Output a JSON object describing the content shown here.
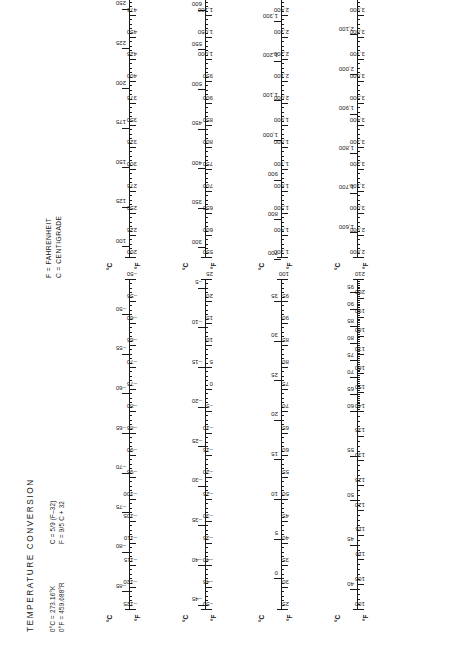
{
  "document": {
    "title": "TEMPERATURE CONVERSION",
    "constants": [
      "0°C = 273.16°K",
      "0°F = 459.688°R"
    ],
    "formulas": [
      "C = 5/9 (F–32)",
      "F = 9/5 C + 32"
    ],
    "legend": [
      "F = FAHRENHEIT",
      "C = CENTIGRADE"
    ],
    "axis_caption_c": "°C",
    "axis_caption_f": "°F"
  },
  "chart_data": {
    "type": "table",
    "title": "TEMPERATURE CONVERSION",
    "xlabel": "°F",
    "ylabel": "°C",
    "grid": false,
    "legend_position": "top-center",
    "scales": [
      {
        "id": "scale-1",
        "column": "left",
        "row": 1,
        "f_range": [
          -125,
          -50
        ],
        "c_range": [
          -87.2,
          -45.6
        ],
        "f_labels": [
          "–125",
          "–120",
          "–115",
          "–110",
          "–105",
          "–100",
          "–95",
          "–90",
          "–85",
          "–80",
          "–75",
          "–70",
          "–65",
          "–60",
          "–55",
          "–50"
        ],
        "f_values": [
          -125,
          -120,
          -115,
          -110,
          -105,
          -100,
          -95,
          -90,
          -85,
          -80,
          -75,
          -70,
          -65,
          -60,
          -55,
          -50
        ],
        "c_labels": [
          "–85",
          "–80",
          "–75",
          "–70",
          "–65",
          "–60",
          "–55",
          "–50"
        ],
        "c_values": [
          -85,
          -80,
          -75,
          -70,
          -65,
          -60,
          -55,
          -50
        ],
        "f_minor_step": 1
      },
      {
        "id": "scale-2",
        "column": "left",
        "row": 2,
        "f_range": [
          -50,
          25
        ],
        "c_range": [
          -45.6,
          -3.9
        ],
        "f_labels": [
          "–50",
          "–45",
          "–40",
          "–35",
          "–30",
          "–25",
          "–20",
          "–15",
          "–10",
          "–5",
          "0",
          "5",
          "10",
          "15",
          "20",
          "25"
        ],
        "f_values": [
          -50,
          -45,
          -40,
          -35,
          -30,
          -25,
          -20,
          -15,
          -10,
          -5,
          0,
          5,
          10,
          15,
          20,
          25
        ],
        "c_labels": [
          "–45",
          "–40",
          "–35",
          "–30",
          "–25",
          "–20",
          "–15",
          "–10",
          "–5"
        ],
        "c_values": [
          -45,
          -40,
          -35,
          -30,
          -25,
          -20,
          -15,
          -10,
          -5
        ],
        "f_minor_step": 1
      },
      {
        "id": "scale-3",
        "column": "left",
        "row": 3,
        "f_range": [
          25,
          100
        ],
        "c_range": [
          -3.9,
          37.8
        ],
        "f_labels": [
          "25",
          "30",
          "35",
          "40",
          "45",
          "50",
          "55",
          "60",
          "65",
          "70",
          "75",
          "80",
          "85",
          "90",
          "95",
          "100"
        ],
        "f_values": [
          25,
          30,
          35,
          40,
          45,
          50,
          55,
          60,
          65,
          70,
          75,
          80,
          85,
          90,
          95,
          100
        ],
        "c_labels": [
          "0",
          "5",
          "10",
          "15",
          "20",
          "25",
          "30",
          "35"
        ],
        "c_values": [
          0,
          5,
          10,
          15,
          20,
          25,
          30,
          35
        ],
        "f_minor_step": 1
      },
      {
        "id": "scale-4",
        "column": "left",
        "row": 4,
        "f_range": [
          100,
          210
        ],
        "c_range": [
          37.8,
          98.9
        ],
        "f_labels": [
          "100",
          "105",
          "110",
          "115",
          "120",
          "125",
          "130",
          "135",
          "140",
          "150",
          "160",
          "170",
          "180",
          "190",
          "200",
          "210"
        ],
        "f_values": [
          100,
          105,
          110,
          115,
          120,
          125,
          130,
          135,
          140,
          150,
          160,
          170,
          180,
          190,
          200,
          210
        ],
        "c_labels": [
          "40",
          "45",
          "50",
          "55",
          "60",
          "65",
          "70",
          "75",
          "80",
          "85",
          "90",
          "95"
        ],
        "c_values": [
          40,
          45,
          50,
          55,
          60,
          65,
          70,
          75,
          80,
          85,
          90,
          95
        ],
        "f_minor_step": 1,
        "note": "scale compresses above 140°F"
      },
      {
        "id": "scale-5",
        "column": "right",
        "row": 1,
        "f_range": [
          200,
          575
        ],
        "c_range": [
          93.3,
          301.7
        ],
        "f_labels": [
          "200",
          "225",
          "250",
          "275",
          "300",
          "325",
          "350",
          "375",
          "400",
          "425",
          "450",
          "475",
          "500",
          "525",
          "550",
          "575"
        ],
        "f_values": [
          200,
          225,
          250,
          275,
          300,
          325,
          350,
          375,
          400,
          425,
          450,
          475,
          500,
          525,
          550,
          575
        ],
        "c_labels": [
          "100",
          "125",
          "150",
          "175",
          "200",
          "225",
          "250",
          "275",
          "300"
        ],
        "c_values": [
          100,
          125,
          150,
          175,
          200,
          225,
          250,
          275,
          300
        ],
        "f_minor_step": 5
      },
      {
        "id": "scale-6",
        "column": "right",
        "row": 2,
        "f_range": [
          550,
          1300
        ],
        "c_range": [
          287.8,
          704.4
        ],
        "f_labels": [
          "550",
          "600",
          "650",
          "700",
          "750",
          "800",
          "850",
          "900",
          "950",
          "1,000",
          "1,050",
          "1,100",
          "1,150",
          "1,200",
          "1,250",
          "1,300"
        ],
        "f_values": [
          550,
          600,
          650,
          700,
          750,
          800,
          850,
          900,
          950,
          1000,
          1050,
          1100,
          1150,
          1200,
          1250,
          1300
        ],
        "c_labels": [
          "300",
          "350",
          "400",
          "450",
          "500",
          "550",
          "600",
          "650",
          "700"
        ],
        "c_values": [
          300,
          350,
          400,
          450,
          500,
          550,
          600,
          650,
          700
        ],
        "f_minor_step": 10
      },
      {
        "id": "scale-7",
        "column": "right",
        "row": 3,
        "f_range": [
          1300,
          2800
        ],
        "c_range": [
          704.4,
          1537.8
        ],
        "f_labels": [
          "1,300",
          "1,400",
          "1,500",
          "1,600",
          "1,700",
          "1,800",
          "1,900",
          "2,000",
          "2,100",
          "2,200",
          "2,300",
          "2,400",
          "2,500",
          "2,600",
          "2,700",
          "2,800"
        ],
        "f_values": [
          1300,
          1400,
          1500,
          1600,
          1700,
          1800,
          1900,
          2000,
          2100,
          2200,
          2300,
          2400,
          2500,
          2600,
          2700,
          2800
        ],
        "c_labels": [
          "700",
          "800",
          "900",
          "1,000",
          "1,100",
          "1,200",
          "1,300",
          "1,400",
          "1,500"
        ],
        "c_values": [
          700,
          800,
          900,
          1000,
          1100,
          1200,
          1300,
          1400,
          1500
        ],
        "f_minor_step": 20
      },
      {
        "id": "scale-8",
        "column": "right",
        "row": 4,
        "f_range": [
          2800,
          4300
        ],
        "c_range": [
          1537.8,
          2371.1
        ],
        "f_labels": [
          "2,800",
          "2,900",
          "3,000",
          "3,100",
          "3,200",
          "3,300",
          "3,400",
          "3,500",
          "3,600",
          "3,700",
          "3,800",
          "3,900",
          "4,000",
          "4,100",
          "4,200",
          "4,300"
        ],
        "f_values": [
          2800,
          2900,
          3000,
          3100,
          3200,
          3300,
          3400,
          3500,
          3600,
          3700,
          3800,
          3900,
          4000,
          4100,
          4200,
          4300
        ],
        "c_labels": [
          "1,600",
          "1,700",
          "1,800",
          "1,900",
          "2,000",
          "2,100",
          "2,200",
          "2,300"
        ],
        "c_values": [
          1600,
          1700,
          1800,
          1900,
          2000,
          2100,
          2200,
          2300
        ],
        "f_minor_step": 20
      }
    ]
  }
}
